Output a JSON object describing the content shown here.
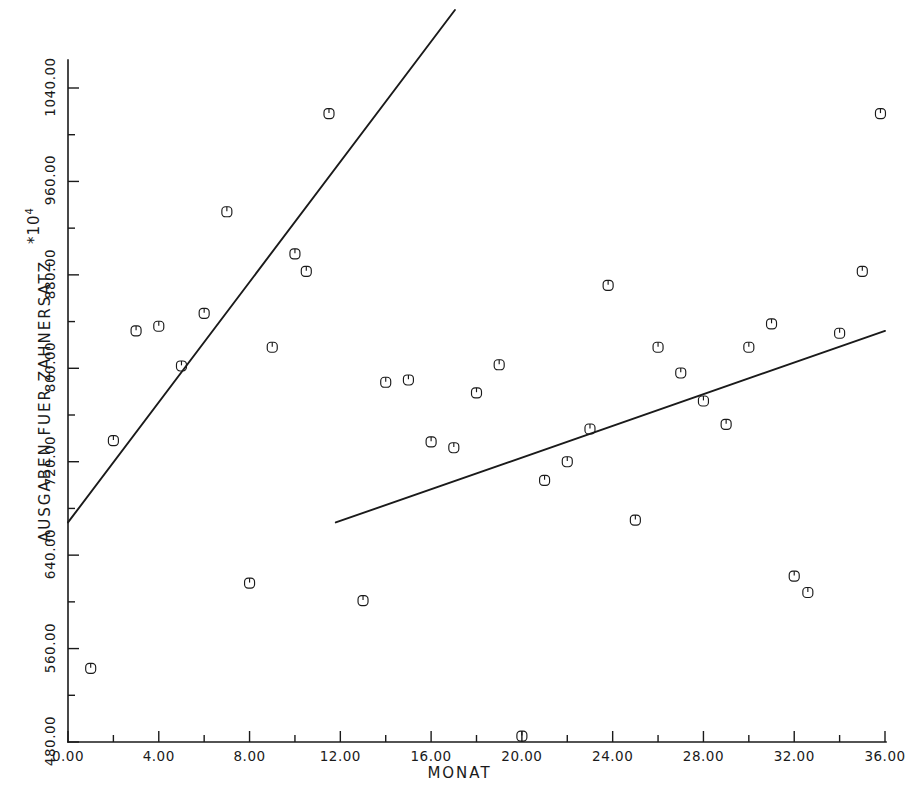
{
  "chart_data": {
    "type": "scatter",
    "title": "",
    "xlabel": "MONAT",
    "ylabel": "AUSGABEN FUER ZAHNERSATZ",
    "y_exponent_note": "*10⁴",
    "xlim": [
      0,
      36
    ],
    "ylim": [
      480,
      1040
    ],
    "x_ticks": [
      0,
      4,
      8,
      12,
      16,
      20,
      24,
      28,
      32,
      36
    ],
    "x_tick_labels": [
      "0.00",
      "4.00",
      "8.00",
      "12.00",
      "16.00",
      "20.00",
      "24.00",
      "28.00",
      "32.00",
      "36.00"
    ],
    "x_minor_step": 2,
    "y_ticks": [
      480,
      560,
      640,
      720,
      800,
      880,
      960,
      1040
    ],
    "y_tick_labels": [
      "480.00",
      "560.00",
      "640.00",
      "720.00",
      "800.00",
      "880.00",
      "960.00",
      "1040.00"
    ],
    "y_minor_step": 40,
    "grid": false,
    "legend": null,
    "marker": "circle-with-top-tick",
    "point_color": "#1a1a1a",
    "line_color": "#1a1a1a",
    "background": "#ffffff",
    "points": [
      {
        "x": 1.0,
        "y": 543
      },
      {
        "x": 2.0,
        "y": 738
      },
      {
        "x": 3.0,
        "y": 832
      },
      {
        "x": 4.0,
        "y": 836
      },
      {
        "x": 5.0,
        "y": 802
      },
      {
        "x": 6.0,
        "y": 847
      },
      {
        "x": 7.0,
        "y": 934
      },
      {
        "x": 8.0,
        "y": 616
      },
      {
        "x": 9.0,
        "y": 818
      },
      {
        "x": 10.0,
        "y": 898
      },
      {
        "x": 10.5,
        "y": 883
      },
      {
        "x": 11.5,
        "y": 1018
      },
      {
        "x": 13.0,
        "y": 601
      },
      {
        "x": 14.0,
        "y": 788
      },
      {
        "x": 15.0,
        "y": 790
      },
      {
        "x": 16.0,
        "y": 737
      },
      {
        "x": 17.0,
        "y": 732
      },
      {
        "x": 18.0,
        "y": 779
      },
      {
        "x": 19.0,
        "y": 803
      },
      {
        "x": 20.0,
        "y": 485
      },
      {
        "x": 21.0,
        "y": 704
      },
      {
        "x": 22.0,
        "y": 720
      },
      {
        "x": 23.0,
        "y": 748
      },
      {
        "x": 23.8,
        "y": 871
      },
      {
        "x": 25.0,
        "y": 670
      },
      {
        "x": 26.0,
        "y": 818
      },
      {
        "x": 27.0,
        "y": 796
      },
      {
        "x": 28.0,
        "y": 772
      },
      {
        "x": 29.0,
        "y": 752
      },
      {
        "x": 30.0,
        "y": 818
      },
      {
        "x": 31.0,
        "y": 838
      },
      {
        "x": 32.0,
        "y": 622
      },
      {
        "x": 32.6,
        "y": 608
      },
      {
        "x": 34.0,
        "y": 830
      },
      {
        "x": 35.0,
        "y": 883
      },
      {
        "x": 35.8,
        "y": 1018
      }
    ],
    "trend_lines": [
      {
        "name": "trend-segment-early",
        "x0": 0.0,
        "y0": 668,
        "x1": 19.0,
        "y1": 1157
      },
      {
        "name": "trend-segment-late",
        "x0": 11.8,
        "y0": 668,
        "x1": 36.0,
        "y1": 832
      }
    ]
  },
  "axis": {
    "x_title": "MONAT",
    "y_title": "AUSGABEN FUER ZAHNERSATZ",
    "exponent": "*10",
    "exponent_power": "4"
  }
}
